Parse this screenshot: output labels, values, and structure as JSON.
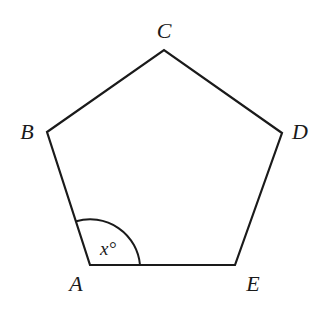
{
  "diagram": {
    "shape": "pentagon",
    "stroke_color": "#1a1a1a",
    "vertices": [
      {
        "name": "A",
        "label": "A",
        "x": 90,
        "y": 265,
        "label_x": 76,
        "label_y": 291
      },
      {
        "name": "B",
        "label": "B",
        "x": 47,
        "y": 132,
        "label_x": 27,
        "label_y": 139
      },
      {
        "name": "C",
        "label": "C",
        "x": 164,
        "y": 50,
        "label_x": 164,
        "label_y": 38
      },
      {
        "name": "D",
        "label": "D",
        "x": 282,
        "y": 133,
        "label_x": 300,
        "label_y": 139
      },
      {
        "name": "E",
        "label": "E",
        "x": 235,
        "y": 265,
        "label_x": 253,
        "label_y": 291
      }
    ],
    "angle_mark": {
      "vertex": "A",
      "label": "x°",
      "radius": 50
    }
  }
}
